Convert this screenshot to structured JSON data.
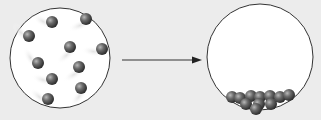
{
  "diagram": {
    "left_container": {
      "label": "",
      "state": "gas",
      "center": [
        60,
        58
      ],
      "radius": 50,
      "particles": [
        [
          52,
          22
        ],
        [
          86,
          19
        ],
        [
          29,
          36
        ],
        [
          70,
          47
        ],
        [
          102,
          49
        ],
        [
          38,
          63
        ],
        [
          79,
          67
        ],
        [
          52,
          79
        ],
        [
          81,
          88
        ],
        [
          48,
          99
        ]
      ]
    },
    "arrow": {
      "from": [
        122,
        60
      ],
      "to": [
        202,
        60
      ],
      "color": "#333333"
    },
    "right_container": {
      "label": "",
      "state": "condensed",
      "center": [
        260,
        57
      ],
      "radius": 53,
      "particles": [
        [
          232,
          97
        ],
        [
          240,
          98
        ],
        [
          251,
          96
        ],
        [
          260,
          97
        ],
        [
          270,
          96
        ],
        [
          280,
          97
        ],
        [
          289,
          95
        ],
        [
          246,
          104
        ],
        [
          259,
          104
        ],
        [
          271,
          104
        ],
        [
          256,
          109
        ]
      ]
    },
    "colors": {
      "background": "#ececec",
      "container_fill": "#ffffff",
      "container_stroke": "#333333",
      "particle": "#555555"
    }
  }
}
